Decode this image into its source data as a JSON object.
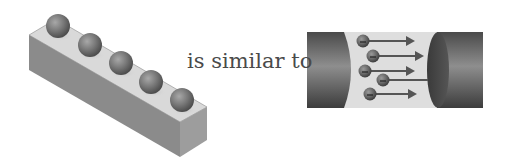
{
  "caption": "is similar to",
  "left_figure": {
    "label": "block-with-balls",
    "ball_count": 5,
    "colors": {
      "top": "#d8d8d8",
      "front": "#8a8a8a",
      "side": "#9c9c9c",
      "ball": "#7a7a7a"
    }
  },
  "right_figure": {
    "label": "wire-with-electrons",
    "electron_count": 5,
    "arrow_count": 5,
    "colors": {
      "cylinder": "#5a5a5a",
      "gap": "#dcdcdc",
      "arrow": "#555555",
      "electron": "#6a6a6a"
    }
  }
}
